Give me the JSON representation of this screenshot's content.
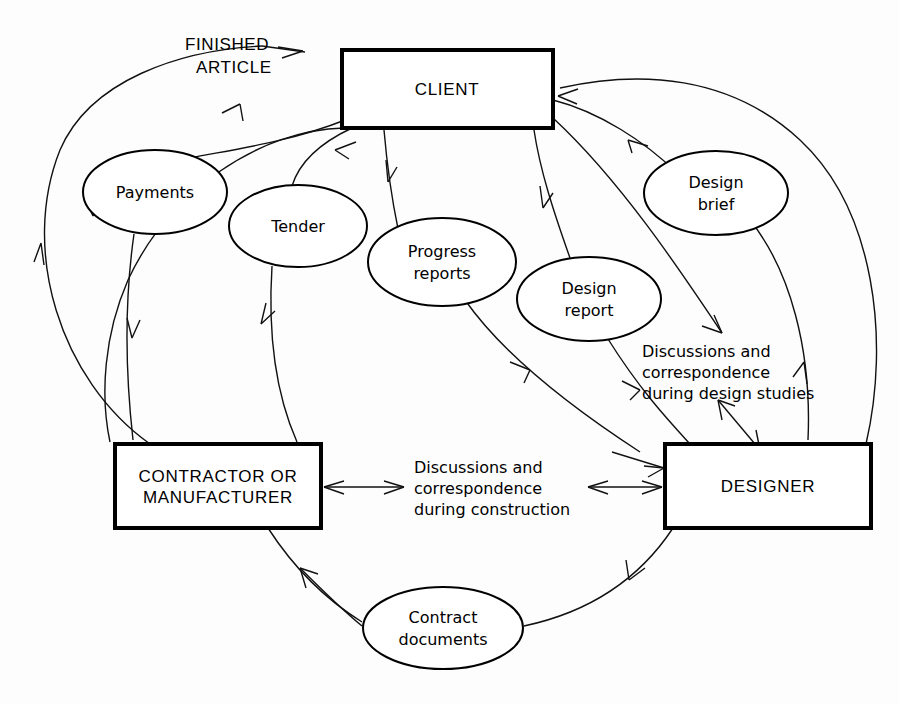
{
  "diagram": {
    "background_color": "#fdfdfd",
    "line_color": "#111111",
    "boxes": [
      {
        "id": "client",
        "label": "CLIENT",
        "x": 342,
        "y": 50,
        "w": 211,
        "h": 78
      },
      {
        "id": "contractor",
        "label_line1": "CONTRACTOR OR",
        "label_line2": "MANUFACTURER",
        "x": 115,
        "y": 444,
        "w": 206,
        "h": 84
      },
      {
        "id": "designer",
        "label": "DESIGNER",
        "x": 665,
        "y": 444,
        "w": 206,
        "h": 84
      }
    ],
    "ellipses": [
      {
        "id": "payments",
        "label_line1": "Payments",
        "label_line2": "",
        "cx": 155,
        "cy": 192,
        "rx": 72,
        "ry": 42
      },
      {
        "id": "tender",
        "label_line1": "Tender",
        "label_line2": "",
        "cx": 298,
        "cy": 226,
        "rx": 69,
        "ry": 41
      },
      {
        "id": "progress-reports",
        "label_line1": "Progress",
        "label_line2": "reports",
        "cx": 442,
        "cy": 262,
        "rx": 74,
        "ry": 44
      },
      {
        "id": "design-report",
        "label_line1": "Design",
        "label_line2": "report",
        "cx": 589,
        "cy": 299,
        "rx": 72,
        "ry": 42
      },
      {
        "id": "design-brief",
        "label_line1": "Design",
        "label_line2": "brief",
        "cx": 716,
        "cy": 193,
        "rx": 72,
        "ry": 42
      },
      {
        "id": "contract-documents",
        "label_line1": "Contract",
        "label_line2": "documents",
        "cx": 443,
        "cy": 628,
        "rx": 80,
        "ry": 41
      }
    ],
    "free_labels": [
      {
        "id": "finished-article",
        "line1": "FINISHED",
        "line2": "ARTICLE",
        "x": 185,
        "y": 45,
        "style": "caps"
      },
      {
        "id": "discussions-design-studies",
        "line1": "Discussions and",
        "line2": "correspondence",
        "line3": "during design studies",
        "x": 642,
        "y": 343,
        "style": "normal"
      },
      {
        "id": "discussions-construction",
        "line1": "Discussions and",
        "line2": "correspondence",
        "line3": "during construction",
        "x": 414,
        "y": 461,
        "style": "normal"
      }
    ],
    "flows": [
      {
        "from": "contractor",
        "to": "client",
        "label": "FINISHED ARTICLE",
        "direction": "up"
      },
      {
        "from": "contractor",
        "to": "client",
        "label": "Payments",
        "direction": "down"
      },
      {
        "from": "contractor",
        "to": "client",
        "label": "Tender",
        "direction": "up"
      },
      {
        "from": "contractor",
        "to": "client",
        "label": "Progress reports",
        "direction": "up"
      },
      {
        "from": "designer",
        "to": "client",
        "label": "Design report",
        "direction": "up"
      },
      {
        "from": "client",
        "to": "designer",
        "label": "Design brief",
        "direction": "down"
      },
      {
        "from": "designer",
        "to": "contractor",
        "label": "Contract documents",
        "direction": "down"
      },
      {
        "from": "client",
        "to": "designer",
        "label": "Discussions and correspondence during design studies",
        "direction": "both"
      },
      {
        "from": "contractor",
        "to": "designer",
        "label": "Discussions and correspondence during construction",
        "direction": "both"
      }
    ]
  }
}
